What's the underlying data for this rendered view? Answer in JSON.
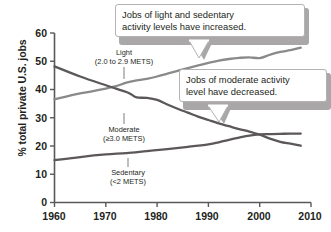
{
  "chart_data": {
    "type": "line",
    "title": "",
    "xlabel": "",
    "ylabel": "% total private U.S. jobs",
    "xlim": [
      1960,
      2010
    ],
    "ylim": [
      0,
      60
    ],
    "xticks": [
      "1960",
      "1970",
      "1980",
      "1990",
      "2000",
      "2010"
    ],
    "yticks": [
      "0",
      "10",
      "20",
      "30",
      "40",
      "50",
      "60"
    ],
    "grid": false,
    "legend_position": "inline-labels",
    "series": [
      {
        "name": "Light",
        "sublabel": "(2.0 to 2.9 METS)",
        "color": "#8a8a8a",
        "x": [
          1960,
          1965,
          1970,
          1972,
          1974,
          1976,
          1978,
          1980,
          1982,
          1984,
          1986,
          1988,
          1990,
          1992,
          1994,
          1996,
          1998,
          2000,
          2002,
          2004,
          2006,
          2008
        ],
        "values": [
          36.5,
          38.6,
          40.3,
          41.2,
          42.4,
          43.2,
          43.8,
          44.6,
          45.6,
          46.6,
          47.6,
          48.5,
          49.4,
          50.2,
          50.8,
          51.2,
          51.4,
          51.1,
          52.3,
          53.3,
          53.9,
          54.8
        ]
      },
      {
        "name": "Moderate",
        "sublabel": "(≥3.0 METS)",
        "color": "#5c585a",
        "x": [
          1960,
          1965,
          1970,
          1972,
          1974,
          1975,
          1976,
          1978,
          1980,
          1982,
          1984,
          1986,
          1988,
          1990,
          1992,
          1994,
          1996,
          1998,
          2000,
          2002,
          2004,
          2006,
          2008
        ],
        "values": [
          48.2,
          44.6,
          41.5,
          40.3,
          39.1,
          38.2,
          37.2,
          37.0,
          36.3,
          34.7,
          33.2,
          31.8,
          30.4,
          29.2,
          28.0,
          27.0,
          26.0,
          25.1,
          24.0,
          22.6,
          21.5,
          20.8,
          20.1
        ]
      },
      {
        "name": "Sedentary",
        "sublabel": "(<2 METS)",
        "color": "#5c585a",
        "x": [
          1960,
          1965,
          1970,
          1974,
          1978,
          1982,
          1986,
          1990,
          1992,
          1994,
          1996,
          1998,
          2000,
          2002,
          2004,
          2006,
          2008
        ],
        "values": [
          15.0,
          16.1,
          17.0,
          17.5,
          18.2,
          18.9,
          19.7,
          20.6,
          21.3,
          22.2,
          23.0,
          23.7,
          24.1,
          24.2,
          24.3,
          24.4,
          24.4
        ]
      }
    ],
    "annotations": [
      {
        "id": "callout-increase",
        "line1": "Jobs of light and sedentary",
        "line2": "activity levels have increased.",
        "points_to": "Light"
      },
      {
        "id": "callout-decrease",
        "line1": "Jobs of moderate activity",
        "line2": "level have decreased.",
        "points_to": "Moderate"
      }
    ]
  }
}
